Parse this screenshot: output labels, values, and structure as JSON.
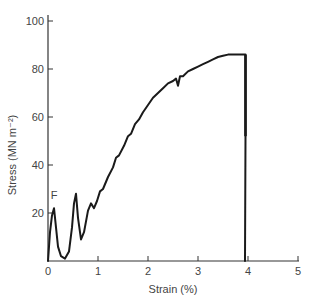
{
  "chart_data": {
    "type": "line",
    "title": "",
    "xlabel": "Strain (%)",
    "ylabel": "Stress (MN m⁻²)",
    "xlim": [
      0,
      5
    ],
    "ylim": [
      0,
      100
    ],
    "xticks": [
      0,
      1,
      2,
      3,
      4,
      5
    ],
    "yticks": [
      20,
      40,
      60,
      80,
      100
    ],
    "xtick_labels": [
      "0",
      "1",
      "2",
      "3",
      "4",
      "5"
    ],
    "ytick_labels": [
      "20",
      "40",
      "60",
      "80",
      "100"
    ],
    "origin_label": "0",
    "grid": false,
    "legend": null,
    "annotations": [
      {
        "text": "F",
        "x": 0.12,
        "y": 25
      }
    ],
    "series": [
      {
        "name": "stress-strain",
        "x": [
          0.0,
          0.04,
          0.08,
          0.12,
          0.15,
          0.2,
          0.26,
          0.34,
          0.42,
          0.48,
          0.52,
          0.56,
          0.6,
          0.66,
          0.72,
          0.8,
          0.86,
          0.92,
          0.98,
          1.04,
          1.1,
          1.2,
          1.3,
          1.36,
          1.42,
          1.52,
          1.6,
          1.66,
          1.74,
          1.82,
          1.9,
          2.0,
          2.1,
          2.2,
          2.3,
          2.4,
          2.5,
          2.56,
          2.6,
          2.64,
          2.7,
          2.8,
          2.9,
          3.0,
          3.1,
          3.2,
          3.3,
          3.4,
          3.5,
          3.6,
          3.7,
          3.8,
          3.92,
          3.95,
          3.95,
          3.94
        ],
        "y": [
          0,
          12,
          19,
          22,
          16,
          6,
          2,
          1,
          4,
          14,
          24,
          28,
          18,
          9,
          12,
          21,
          24,
          22,
          25,
          29,
          30,
          35,
          39,
          43,
          44,
          48,
          52,
          53,
          57,
          59,
          62,
          65,
          68,
          70,
          72,
          74,
          75,
          76,
          73,
          77,
          77,
          79,
          80,
          81,
          82,
          83,
          84,
          85,
          85.5,
          86,
          86,
          86,
          86,
          86,
          52,
          0
        ]
      }
    ],
    "failure": {
      "strain": 3.95,
      "stress_peak": 86
    }
  }
}
